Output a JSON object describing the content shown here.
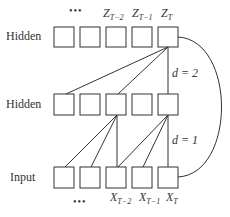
{
  "diagram": {
    "type": "dilated-causal-convolution",
    "rows": {
      "top": {
        "label": "Hidden",
        "box_count": 5
      },
      "middle": {
        "label": "Hidden",
        "box_count": 5
      },
      "bottom": {
        "label": "Input",
        "box_count": 5
      }
    },
    "top_labels": {
      "ellipsis": "•••",
      "z_t2": {
        "base": "Z",
        "sub": "T−2"
      },
      "z_t1": {
        "base": "Z",
        "sub": "T−1"
      },
      "z_t": {
        "base": "Z",
        "sub": "T"
      }
    },
    "bottom_labels": {
      "ellipsis": "•••",
      "x_t2": {
        "base": "X",
        "sub": "T−2"
      },
      "x_t1": {
        "base": "X",
        "sub": "T−1"
      },
      "x_t": {
        "base": "X",
        "sub": "T"
      }
    },
    "dilations": {
      "upper": "d = 2",
      "lower": "d = 1"
    },
    "stroke_color": "#333333"
  }
}
